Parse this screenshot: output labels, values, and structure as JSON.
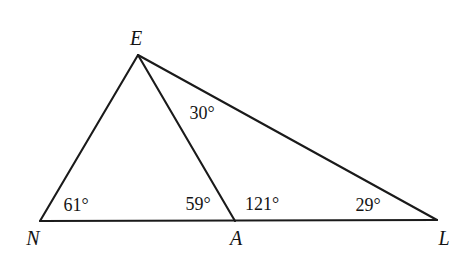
{
  "figure": {
    "background_color": "#ffffff",
    "stroke_color": "#1a1a1a",
    "text_color": "#141414",
    "width": 469,
    "height": 254
  },
  "points": [
    {
      "id": "E",
      "label": "E",
      "x": 138,
      "y": 55,
      "label_x": 136,
      "label_y": 38
    },
    {
      "id": "N",
      "label": "N",
      "x": 40,
      "y": 221,
      "label_x": 33,
      "label_y": 238
    },
    {
      "id": "A",
      "label": "A",
      "x": 235,
      "y": 221,
      "label_x": 236,
      "label_y": 238
    },
    {
      "id": "L",
      "label": "L",
      "x": 437,
      "y": 220,
      "label_x": 444,
      "label_y": 238
    }
  ],
  "segments": [
    {
      "id": "NE",
      "from": "N",
      "to": "E",
      "x1": 40,
      "y1": 221,
      "x2": 138,
      "y2": 55
    },
    {
      "id": "EA",
      "from": "E",
      "to": "A",
      "x1": 138,
      "y1": 55,
      "x2": 235,
      "y2": 221
    },
    {
      "id": "EL",
      "from": "E",
      "to": "L",
      "x1": 138,
      "y1": 55,
      "x2": 437,
      "y2": 220
    },
    {
      "id": "NL",
      "from": "N",
      "to": "L",
      "x1": 40,
      "y1": 221,
      "x2": 437,
      "y2": 220
    }
  ],
  "angles": [
    {
      "id": "angle-N",
      "vertex": "N",
      "text": "61°",
      "x": 76,
      "y": 205
    },
    {
      "id": "angle-EAN",
      "vertex": "A",
      "text": "59°",
      "x": 198,
      "y": 204
    },
    {
      "id": "angle-EAL",
      "vertex": "A",
      "text": "121°",
      "x": 262,
      "y": 204
    },
    {
      "id": "angle-AEL",
      "vertex": "E",
      "text": "30°",
      "x": 202,
      "y": 113
    },
    {
      "id": "angle-L",
      "vertex": "L",
      "text": "29°",
      "x": 368,
      "y": 205
    }
  ]
}
